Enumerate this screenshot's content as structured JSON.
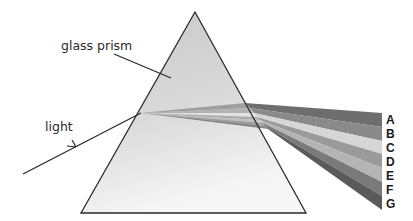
{
  "diagram": {
    "labels": {
      "prism": "glass prism",
      "light": "light"
    },
    "bands": [
      {
        "label": "A",
        "color": "#6e6e6e"
      },
      {
        "label": "B",
        "color": "#8a8a8a"
      },
      {
        "label": "C",
        "color": "#d6d6d6"
      },
      {
        "label": "D",
        "color": "#9a9a9a"
      },
      {
        "label": "E",
        "color": "#b4b4b4"
      },
      {
        "label": "F",
        "color": "#7a7a7a"
      },
      {
        "label": "G",
        "color": "#5a5a5a"
      }
    ],
    "colors": {
      "prism_fill_top": "#cfcfcf",
      "prism_fill_bottom": "#f4f4f4",
      "outline": "#2a2a2a"
    }
  }
}
